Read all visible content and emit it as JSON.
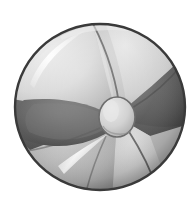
{
  "canvas": {
    "width": 196,
    "height": 200,
    "background_color": "#ffffff",
    "title": "Beach ball"
  },
  "artwork": {
    "name": "beach-ball",
    "subject": "beach ball",
    "style": "grayscale shaded illustration",
    "alt_text": "A grayscale beach ball with six radiating panels and a small oval hub at the center"
  },
  "ball": {
    "center_x": 100,
    "center_y": 107,
    "radius_x": 85,
    "radius_y": 83,
    "outline_color": "#3a3a3a",
    "outline_width": 2.4,
    "base_color": "#b9b9b9"
  },
  "hub": {
    "name": "center-hub",
    "center_x": 117,
    "center_y": 117,
    "radius_x": 18,
    "radius_y": 20,
    "fill_color": "#cfcfcf",
    "highlight_color": "#e4e4e4",
    "outline_color": "#6d6d6d"
  },
  "panels": [
    {
      "id": "panel-top",
      "label": "Top panel",
      "tone": "light",
      "color": "#cdcdcd"
    },
    {
      "id": "panel-upper-right",
      "label": "Upper right panel",
      "tone": "dark",
      "color": "#5d5d5d"
    },
    {
      "id": "panel-lower-right",
      "label": "Lower right panel",
      "tone": "light",
      "color": "#c6c6c6"
    },
    {
      "id": "panel-bottom",
      "label": "Bottom panel",
      "tone": "medium",
      "color": "#b0b0b0"
    },
    {
      "id": "panel-lower-left",
      "label": "Lower left panel",
      "tone": "dark",
      "color": "#575757"
    },
    {
      "id": "panel-upper-left",
      "label": "Upper left panel",
      "tone": "light",
      "color": "#d4d4d4"
    }
  ],
  "highlights": [
    {
      "id": "highlight-upper-left",
      "label": "Upper left specular streak",
      "color": "#fbfbfb",
      "opacity": 0.95
    },
    {
      "id": "highlight-lower-left",
      "label": "Lower left specular streak",
      "color": "#f2f2f2",
      "opacity": 0.85
    },
    {
      "id": "highlight-rim-top",
      "label": "Top rim sheen",
      "color": "#ededed",
      "opacity": 0.6
    }
  ],
  "shading": {
    "rim_shadow_color": "#4a4a4a",
    "inner_shadow_color": "#6f6f6f",
    "ambient_occlusion_color": "#7d7d7d"
  },
  "seams": {
    "color": "#4f4f4f",
    "width": 1.8
  }
}
